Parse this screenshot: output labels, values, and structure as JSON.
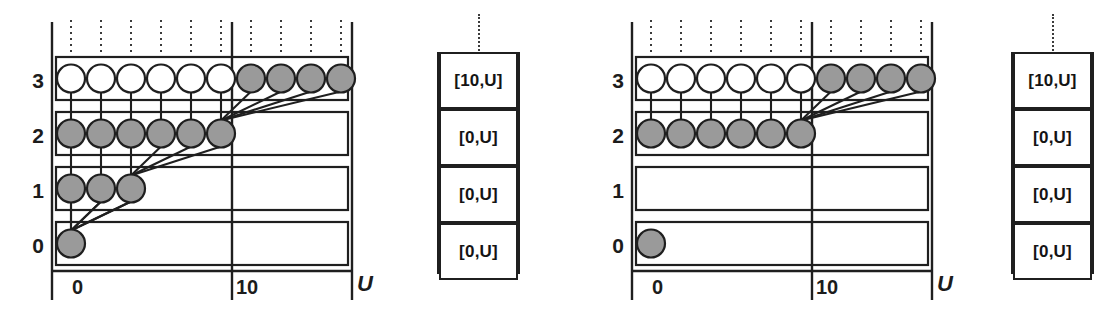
{
  "figure": {
    "title": "",
    "panels": [
      {
        "id": "left",
        "row_labels": [
          "3",
          "2",
          "1",
          "0"
        ],
        "axis_ticks": [
          {
            "label": "0",
            "value": 0
          },
          {
            "label": "10",
            "value": 10
          },
          {
            "label": "U",
            "value": 16
          }
        ],
        "rows": [
          {
            "level": "3",
            "circles": [
              {
                "fill": "white"
              },
              {
                "fill": "white"
              },
              {
                "fill": "white"
              },
              {
                "fill": "white"
              },
              {
                "fill": "white"
              },
              {
                "fill": "white"
              },
              {
                "fill": "gray"
              },
              {
                "fill": "gray"
              },
              {
                "fill": "gray"
              },
              {
                "fill": "gray"
              }
            ]
          },
          {
            "level": "2",
            "circles": [
              {
                "fill": "gray"
              },
              {
                "fill": "gray"
              },
              {
                "fill": "gray"
              },
              {
                "fill": "gray"
              },
              {
                "fill": "gray"
              },
              {
                "fill": "gray"
              }
            ]
          },
          {
            "level": "1",
            "circles": [
              {
                "fill": "gray"
              },
              {
                "fill": "gray"
              },
              {
                "fill": "gray"
              }
            ]
          },
          {
            "level": "0",
            "circles": [
              {
                "fill": "gray"
              }
            ]
          }
        ],
        "state_cells": [
          "[10,U]",
          "[0,U]",
          "[0,U]",
          "[0,U]"
        ]
      },
      {
        "id": "right",
        "row_labels": [
          "3",
          "2",
          "1",
          "0"
        ],
        "axis_ticks": [
          {
            "label": "0",
            "value": 0
          },
          {
            "label": "10",
            "value": 10
          },
          {
            "label": "U",
            "value": 16
          }
        ],
        "rows": [
          {
            "level": "3",
            "circles": [
              {
                "fill": "white"
              },
              {
                "fill": "white"
              },
              {
                "fill": "white"
              },
              {
                "fill": "white"
              },
              {
                "fill": "white"
              },
              {
                "fill": "white"
              },
              {
                "fill": "gray"
              },
              {
                "fill": "gray"
              },
              {
                "fill": "gray"
              },
              {
                "fill": "gray"
              }
            ]
          },
          {
            "level": "2",
            "circles": [
              {
                "fill": "gray"
              },
              {
                "fill": "gray"
              },
              {
                "fill": "gray"
              },
              {
                "fill": "gray"
              },
              {
                "fill": "gray"
              },
              {
                "fill": "gray"
              }
            ]
          },
          {
            "level": "1",
            "circles": []
          },
          {
            "level": "0",
            "circles": [
              {
                "fill": "gray"
              }
            ]
          }
        ],
        "state_cells": [
          "[10,U]",
          "[0,U]",
          "[0,U]",
          "[0,U]"
        ]
      }
    ],
    "colors": {
      "circle_gray": "#9a9a9a",
      "circle_white": "#ffffff",
      "stroke": "#1f1f1f",
      "dotted": "#3b3b3b"
    }
  },
  "chart_data": {
    "type": "diagram",
    "title": "",
    "xlabel": "U",
    "ylabel": "",
    "xticks": [
      "0",
      "10",
      "U"
    ],
    "yticks": [
      "0",
      "1",
      "2",
      "3"
    ],
    "panels": [
      {
        "name": "left",
        "counts_per_level": {
          "0": 1,
          "1": 3,
          "2": 6,
          "3": 10
        },
        "filled_per_level": {
          "0": 1,
          "1": 3,
          "2": 6,
          "3": 4
        },
        "open_per_level": {
          "0": 0,
          "1": 0,
          "2": 0,
          "3": 6
        },
        "state_vector": [
          "[10,U]",
          "[0,U]",
          "[0,U]",
          "[0,U]"
        ]
      },
      {
        "name": "right",
        "counts_per_level": {
          "0": 1,
          "1": 0,
          "2": 6,
          "3": 10
        },
        "filled_per_level": {
          "0": 1,
          "1": 0,
          "2": 6,
          "3": 4
        },
        "open_per_level": {
          "0": 0,
          "1": 0,
          "2": 0,
          "3": 6
        },
        "state_vector": [
          "[10,U]",
          "[0,U]",
          "[0,U]",
          "[0,U]"
        ]
      }
    ]
  }
}
